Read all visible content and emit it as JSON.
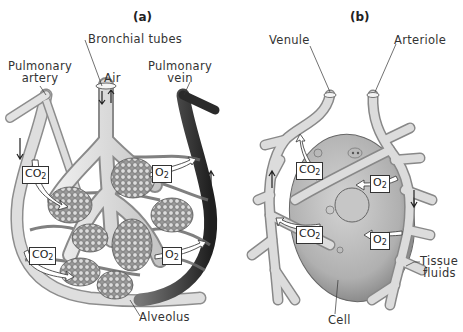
{
  "panels": [
    {
      "id": "a",
      "label": "(a)",
      "title_labels": {
        "bronchial_tubes": "Bronchial tubes",
        "pulmonary_artery": [
          "Pulmonary",
          "artery"
        ],
        "air": "Air",
        "pulmonary_vein": [
          "Pulmonary",
          "vein"
        ],
        "alveolus": "Alveolus"
      },
      "gas_boxes": [
        {
          "gas": "CO",
          "sub": "2",
          "direction": "into alveolus"
        },
        {
          "gas": "CO",
          "sub": "2",
          "direction": "into alveolus"
        },
        {
          "gas": "O",
          "sub": "2",
          "direction": "into pulmonary vein"
        },
        {
          "gas": "O",
          "sub": "2",
          "direction": "into pulmonary vein"
        }
      ]
    },
    {
      "id": "b",
      "label": "(b)",
      "title_labels": {
        "venule": "Venule",
        "arteriole": "Arteriole",
        "tissue_fluids": [
          "Tissue",
          "fluids"
        ],
        "cell": "Cell"
      },
      "gas_boxes": [
        {
          "gas": "CO",
          "sub": "2",
          "direction": "into venule"
        },
        {
          "gas": "CO",
          "sub": "2",
          "direction": "into venule"
        },
        {
          "gas": "O",
          "sub": "2",
          "direction": "into cell"
        },
        {
          "gas": "O",
          "sub": "2",
          "direction": "into cell"
        }
      ]
    }
  ],
  "colors": {
    "vessel_light": "#d8d8d8",
    "vessel_dark": "#3a3a3a",
    "outline": "#555555",
    "cell_fill": "#b9b9b9"
  }
}
